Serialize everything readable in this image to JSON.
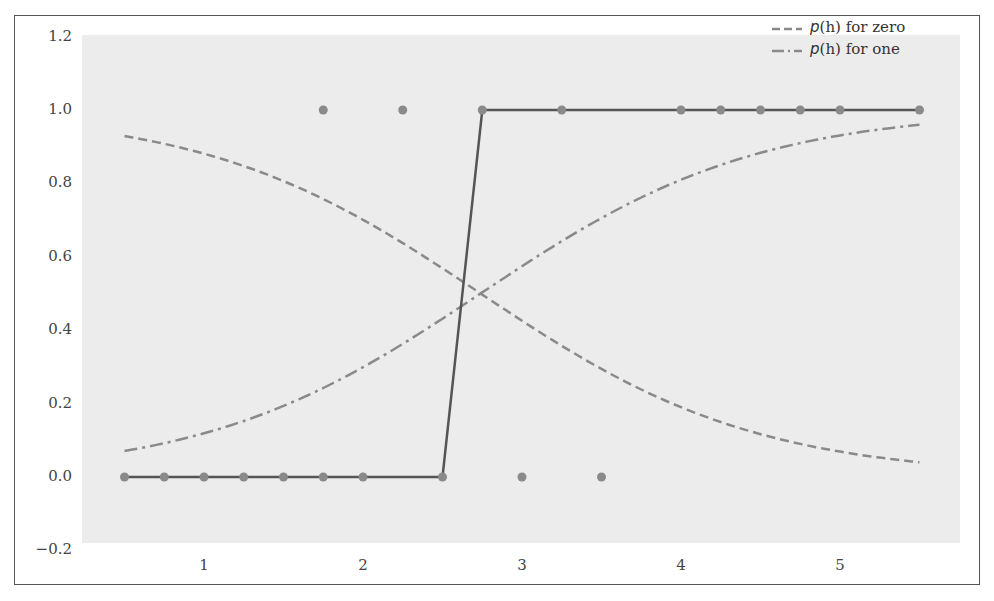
{
  "chart_data": {
    "type": "line",
    "title": "",
    "xlabel": "",
    "ylabel": "",
    "xlim": [
      0.35,
      5.85
    ],
    "ylim": [
      -0.2,
      1.2
    ],
    "x_ticks": [
      1,
      2,
      3,
      4,
      5
    ],
    "x_tick_labels": [
      "1",
      "2",
      "3",
      "4",
      "5"
    ],
    "y_ticks": [
      -0.2,
      0.0,
      0.2,
      0.4,
      0.6,
      0.8,
      1.0,
      1.2
    ],
    "y_tick_labels": [
      "−0.2",
      "0.0",
      "0.2",
      "0.4",
      "0.6",
      "0.8",
      "1.0",
      "1.2"
    ],
    "grid": false,
    "legend_position": "upper right",
    "series": [
      {
        "name": "p(h) for zero",
        "style": "dashed",
        "color": "#8a8a8a",
        "x": [
          0.5,
          1.0,
          1.5,
          2.0,
          2.5,
          2.74,
          3.0,
          3.5,
          4.0,
          4.5,
          5.0,
          5.5
        ],
        "values": [
          0.93,
          0.89,
          0.8,
          0.7,
          0.57,
          0.5,
          0.43,
          0.29,
          0.19,
          0.12,
          0.07,
          0.05
        ]
      },
      {
        "name": "p(h) for one",
        "style": "dash-dot",
        "color": "#8a8a8a",
        "x": [
          0.5,
          1.0,
          1.5,
          2.0,
          2.5,
          2.74,
          3.0,
          3.5,
          4.0,
          4.5,
          5.0,
          5.5
        ],
        "values": [
          0.07,
          0.11,
          0.2,
          0.3,
          0.43,
          0.5,
          0.57,
          0.71,
          0.81,
          0.88,
          0.93,
          0.96
        ]
      },
      {
        "name": "step fit",
        "style": "solid",
        "color": "#555555",
        "x": [
          0.5,
          0.75,
          1.0,
          1.25,
          1.5,
          1.75,
          2.0,
          2.5,
          2.75,
          3.25,
          4.0,
          4.25,
          4.5,
          4.75,
          5.0,
          5.5
        ],
        "values": [
          0,
          0,
          0,
          0,
          0,
          0,
          0,
          0,
          1,
          1,
          1,
          1,
          1,
          1,
          1,
          1
        ]
      },
      {
        "name": "observations",
        "style": "scatter",
        "color": "#8a8a8a",
        "x": [
          0.5,
          0.75,
          1.0,
          1.25,
          1.5,
          1.75,
          2.0,
          2.5,
          3.0,
          3.5,
          1.75,
          2.25,
          2.75,
          3.25,
          4.0,
          4.25,
          4.5,
          4.75,
          5.0,
          5.5
        ],
        "values": [
          0,
          0,
          0,
          0,
          0,
          0,
          0,
          0,
          0,
          0,
          1,
          1,
          1,
          1,
          1,
          1,
          1,
          1,
          1,
          1
        ]
      }
    ]
  },
  "legend": {
    "items": [
      {
        "prefix": "p",
        "var": "(h)",
        "suffix": " for zero",
        "style": "dashed"
      },
      {
        "prefix": "p",
        "var": "(h)",
        "suffix": " for one",
        "style": "dash-dot"
      }
    ]
  },
  "colors": {
    "plot_background": "#ececec",
    "frame": "#555555",
    "step_line": "#555555",
    "curves": "#8a8a8a",
    "points": "#8a8a8a"
  }
}
